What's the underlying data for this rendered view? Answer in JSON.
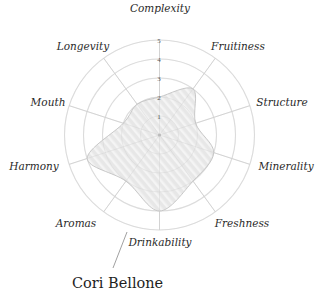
{
  "chart_data": {
    "type": "radar",
    "title": "Cori Bellone",
    "categories": [
      "Complexity",
      "Fruitiness",
      "Structure",
      "Minerality",
      "Freshness",
      "Drinkability",
      "Aromas",
      "Harmony",
      "Mouth",
      "Longevity"
    ],
    "series": [
      {
        "name": "Cori Bellone",
        "values": [
          2,
          3,
          2,
          3,
          3,
          4,
          3,
          4,
          2,
          2
        ]
      }
    ],
    "rlim": [
      0,
      5
    ],
    "r_ticks": [
      "1",
      "2",
      "3",
      "4",
      "5"
    ],
    "grid": true,
    "legend": "none"
  },
  "style": {
    "ring_color": "#e2e2e2",
    "spoke_color": "#d6d6d6",
    "fill_color": "#e6e6e6",
    "stroke_color": "#bdbdbd",
    "stripe_color": "#f4f4f4"
  },
  "labels": {
    "wine_name": "Cori Bellone"
  }
}
